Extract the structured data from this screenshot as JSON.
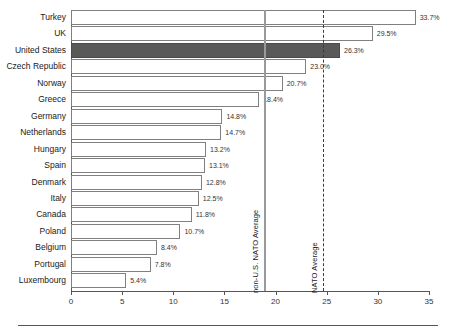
{
  "chart_data": {
    "type": "bar",
    "orientation": "horizontal",
    "title": "",
    "subtitle": "",
    "xlabel": "",
    "ylabel": "",
    "xlim": [
      0,
      35
    ],
    "xticks": [
      0,
      5,
      10,
      15,
      20,
      25,
      30,
      35
    ],
    "grid": false,
    "legend": "none",
    "value_suffix": "%",
    "categories": [
      "Turkey",
      "UK",
      "United States",
      "Czech Republic",
      "Norway",
      "Greece",
      "Germany",
      "Netherlands",
      "Hungary",
      "Spain",
      "Denmark",
      "Italy",
      "Canada",
      "Poland",
      "Belgium",
      "Portugal",
      "Luxembourg"
    ],
    "values": [
      33.7,
      29.5,
      26.3,
      23.0,
      20.7,
      18.4,
      14.8,
      14.7,
      13.2,
      13.1,
      12.8,
      12.5,
      11.8,
      10.7,
      8.4,
      7.8,
      5.4
    ],
    "value_labels": [
      "33.7%",
      "29.5%",
      "26.3%",
      "23.0%",
      "20.7%",
      "18.4%",
      "14.8%",
      "14.7%",
      "13.2%",
      "13.1%",
      "12.8%",
      "12.5%",
      "11.8%",
      "10.7%",
      "8.4%",
      "7.8%",
      "5.4%"
    ],
    "highlight_category": "United States",
    "highlight_color": "#595959",
    "bar_color": "#ffffff",
    "bar_border_color": "#808080",
    "reference_lines": [
      {
        "label": "non-U.S. NATO Average",
        "value": 18.9,
        "style": "solid",
        "color": "#9a9a9a"
      },
      {
        "label": "NATO Average",
        "value": 24.6,
        "style": "dashed",
        "color": "#3a3a3a"
      }
    ]
  },
  "xtick_labels": [
    "0",
    "5",
    "10",
    "15",
    "20",
    "25",
    "30",
    "35"
  ]
}
